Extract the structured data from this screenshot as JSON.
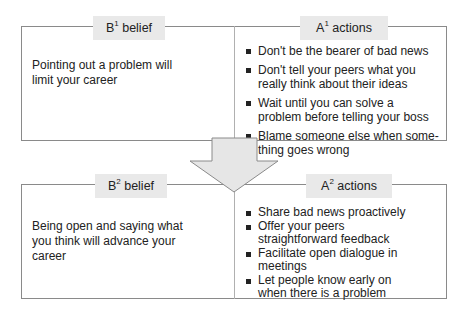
{
  "top": {
    "belief": {
      "label_main": "B",
      "label_sup": "1",
      "label_rest": " belief",
      "text": "Pointing out a problem will limit your career"
    },
    "actions": {
      "label_main": "A",
      "label_sup": "1",
      "label_rest": " actions",
      "items": [
        "Don't be the bearer of bad news",
        "Don't tell your peers what you really think about their ideas",
        "Wait until you can solve a problem before telling your boss",
        "Blame someone else when some-thing goes wrong"
      ]
    }
  },
  "bottom": {
    "belief": {
      "label_main": "B",
      "label_sup": "2",
      "label_rest": " belief",
      "text": "Being open and saying what you think will advance your career"
    },
    "actions": {
      "label_main": "A",
      "label_sup": "2",
      "label_rest": " actions",
      "items": [
        "Share bad news proactively",
        "Offer your peers straightforward feedback",
        "Facilitate open dialogue in meetings",
        "Let people know early on when there is a problem"
      ]
    }
  },
  "arrow": {
    "icon": "down-arrow-icon",
    "fill": "#e6e6e6",
    "stroke": "#8a8a8a"
  }
}
